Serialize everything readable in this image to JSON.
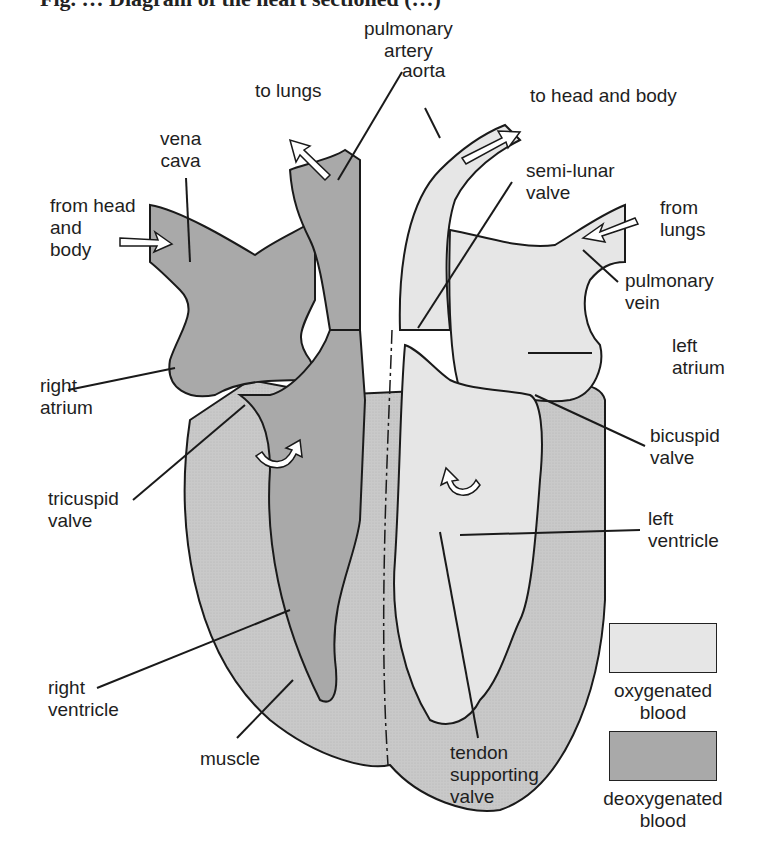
{
  "title": "Fig. … Diagram of the heart sectioned (…)",
  "colors": {
    "oxygenated": "#e6e6e6",
    "deoxygenated": "#a9a9a9",
    "muscle": "#c9c9c9",
    "outline": "#1a1a1a",
    "background": "#ffffff"
  },
  "labels": {
    "pulmonary_artery": "pulmonary\nartery",
    "aorta": "aorta",
    "to_lungs": "to lungs",
    "to_head_and_body": "to head and body",
    "vena_cava": "vena\ncava",
    "semi_lunar_valve": "semi-lunar\nvalve",
    "from_head_and_body": "from head\nand\nbody",
    "from_lungs": "from\nlungs",
    "pulmonary_vein": "pulmonary\nvein",
    "right_atrium": "right\natrium",
    "left_atrium": "left\natrium",
    "bicuspid_valve": "bicuspid\nvalve",
    "tricuspid_valve": "tricuspid\nvalve",
    "left_ventricle": "left\nventricle",
    "right_ventricle": "right\nventricle",
    "muscle": "muscle",
    "tendon_supporting_valve": "tendon\nsupporting\nvalve"
  },
  "legend": [
    {
      "label": "oxygenated\nblood",
      "swatch": "oxygenated"
    },
    {
      "label": "deoxygenated\nblood",
      "swatch": "deoxygenated"
    }
  ]
}
